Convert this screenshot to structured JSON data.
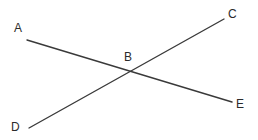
{
  "diagram": {
    "type": "intersecting-lines",
    "background": "#ffffff",
    "line_color": "#3a3a3a",
    "label_color": "#2b2b2b",
    "points": {
      "A": {
        "label": "A",
        "x": 27,
        "y": 40,
        "label_x": 14,
        "label_y": 32
      },
      "B": {
        "label": "B",
        "x": 130,
        "y": 71,
        "label_x": 124,
        "label_y": 61
      },
      "C": {
        "label": "C",
        "x": 224,
        "y": 19,
        "label_x": 228,
        "label_y": 18
      },
      "D": {
        "label": "D",
        "x": 29,
        "y": 128,
        "label_x": 11,
        "label_y": 131
      },
      "E": {
        "label": "E",
        "x": 232,
        "y": 102,
        "label_x": 236,
        "label_y": 108
      }
    },
    "segments": [
      {
        "name": "AE",
        "from": "A",
        "to": "E"
      },
      {
        "name": "DC",
        "from": "D",
        "to": "C"
      }
    ],
    "intersection": "B"
  }
}
